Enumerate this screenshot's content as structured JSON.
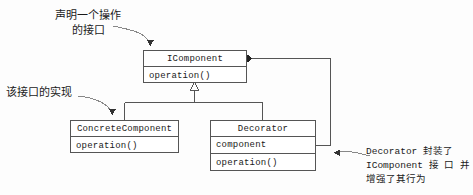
{
  "diagram": {
    "background_color": "#fdfdfd",
    "line_color": "#555555",
    "text_color": "#1a1a1a"
  },
  "classes": {
    "icomponent": {
      "name": "IComponent",
      "operations": [
        "operation()"
      ]
    },
    "concrete_component": {
      "name": "ConcreteComponent",
      "operations": [
        "operation()"
      ]
    },
    "decorator": {
      "name": "Decorator",
      "attributes": [
        "component"
      ],
      "operations": [
        "operation()"
      ]
    }
  },
  "annotations": {
    "declare_interface": {
      "lines": [
        "声明一个操作",
        "的接口"
      ]
    },
    "implements_interface": {
      "lines": [
        "该接口的实现"
      ]
    },
    "decorator_wraps": {
      "lines": [
        "Decorator 封装了",
        "IComponent 接 口 并",
        "增强了其行为"
      ]
    }
  },
  "relationships": [
    {
      "kind": "generalization",
      "from": "ConcreteComponent",
      "to": "IComponent",
      "marker": "hollow-triangle"
    },
    {
      "kind": "generalization",
      "from": "Decorator",
      "to": "IComponent",
      "marker": "hollow-triangle"
    },
    {
      "kind": "aggregation",
      "from": "IComponent",
      "to": "Decorator.component",
      "marker": "filled-diamond"
    }
  ]
}
